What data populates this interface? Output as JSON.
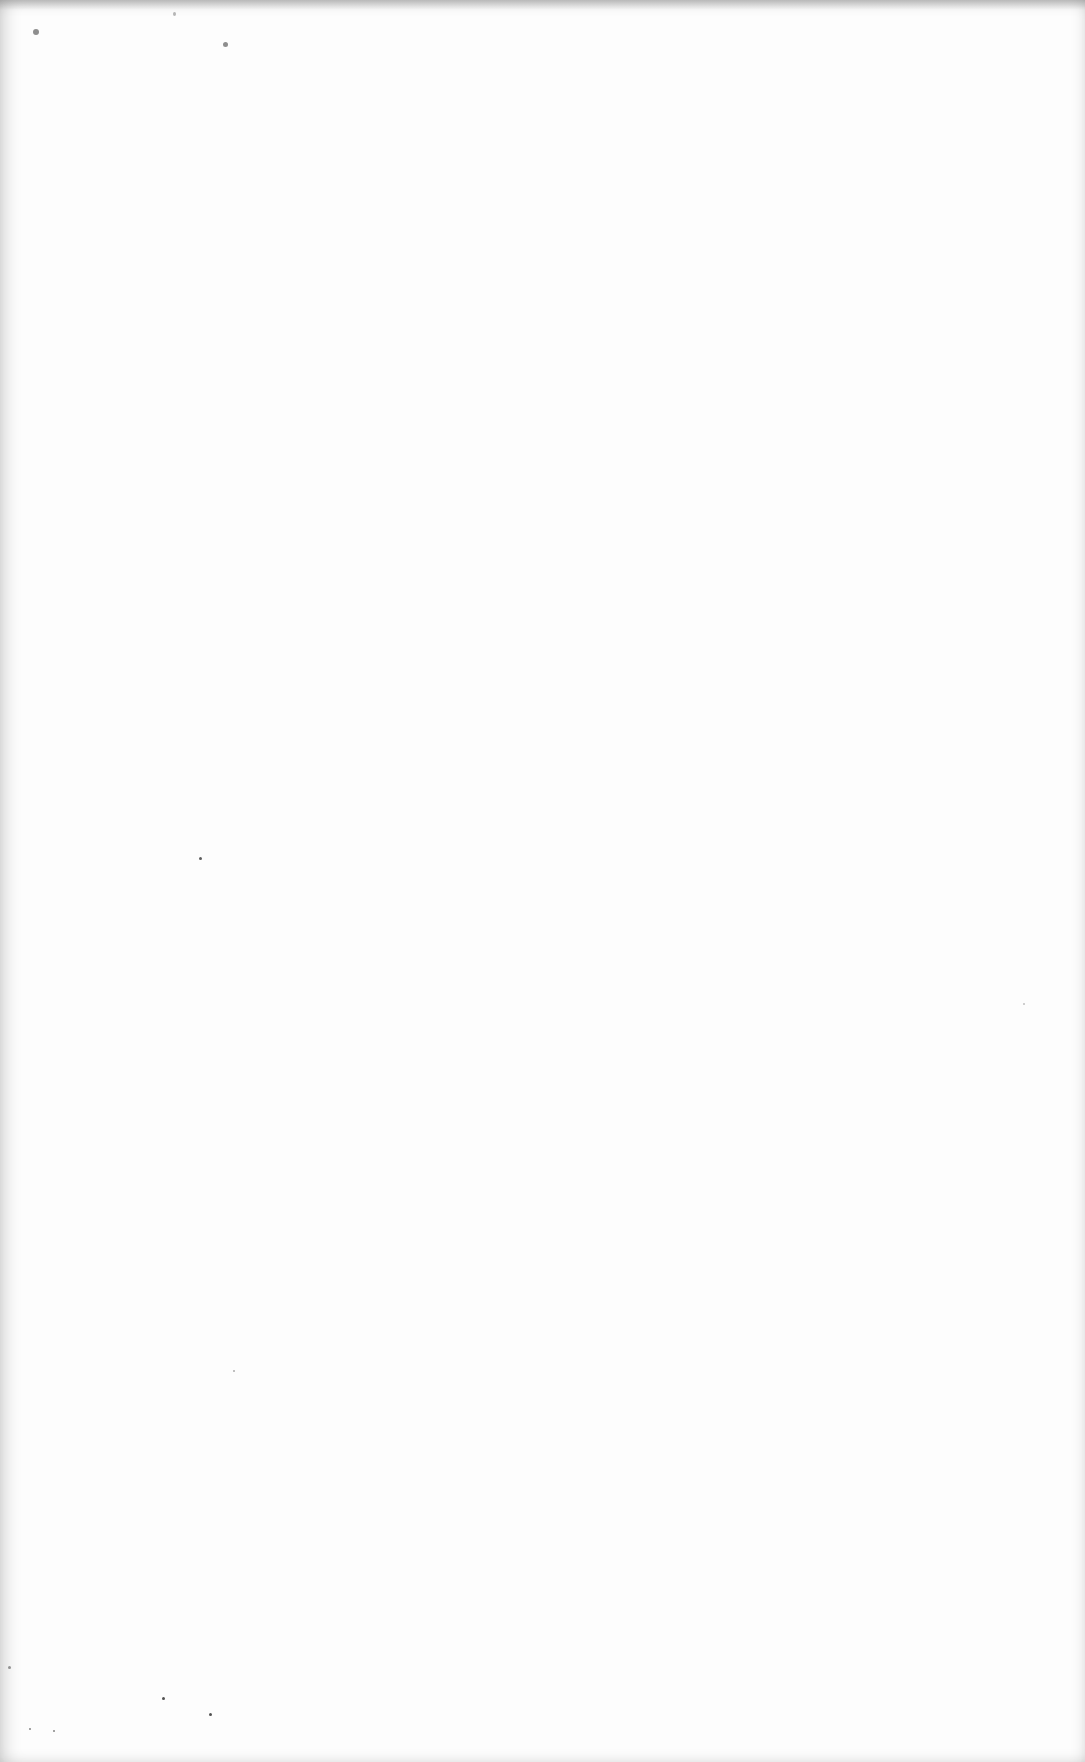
{
  "document": {
    "type": "blank scanned page",
    "text": ""
  },
  "specks": [
    {
      "x": 33,
      "y": 29,
      "w": 6,
      "h": 6,
      "o": 0.55
    },
    {
      "x": 223,
      "y": 42,
      "w": 5,
      "h": 5,
      "o": 0.55
    },
    {
      "x": 173,
      "y": 12,
      "w": 3,
      "h": 4,
      "o": 0.35
    },
    {
      "x": 199,
      "y": 857,
      "w": 3,
      "h": 3,
      "o": 0.8
    },
    {
      "x": 162,
      "y": 1697,
      "w": 3,
      "h": 3,
      "o": 0.85
    },
    {
      "x": 209,
      "y": 1713,
      "w": 3,
      "h": 3,
      "o": 0.85
    },
    {
      "x": 233,
      "y": 1370,
      "w": 2,
      "h": 2,
      "o": 0.4
    },
    {
      "x": 1023,
      "y": 1003,
      "w": 2,
      "h": 2,
      "o": 0.3
    },
    {
      "x": 8,
      "y": 1666,
      "w": 3,
      "h": 3,
      "o": 0.5
    },
    {
      "x": 29,
      "y": 1728,
      "w": 2,
      "h": 2,
      "o": 0.6
    },
    {
      "x": 53,
      "y": 1730,
      "w": 2,
      "h": 2,
      "o": 0.6
    }
  ]
}
